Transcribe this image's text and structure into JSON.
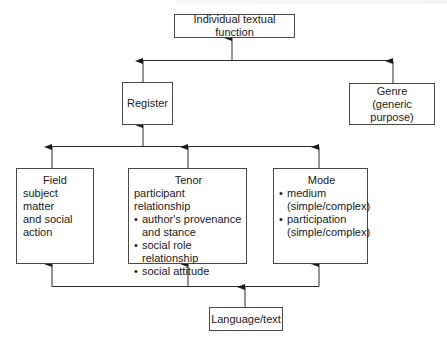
{
  "diagram": {
    "type": "hierarchy-flow",
    "direction": "bottom-to-top",
    "colors": {
      "line": "#2a2a2a",
      "box_border": "#4a4a4a",
      "text": "#1a1a1a",
      "background": "#ffffff"
    },
    "nodes": {
      "individual_textual_function": {
        "label": "Individual textual function"
      },
      "register": {
        "label": "Register"
      },
      "genre": {
        "title": "Genre",
        "subtitle": "(generic purpose)"
      },
      "field": {
        "title": "Field",
        "lines": [
          "subject matter",
          "and social",
          "action"
        ]
      },
      "tenor": {
        "title": "Tenor",
        "subtitle": "participant relationship",
        "bullets": [
          {
            "line1": "author's provenance",
            "line2": "and stance"
          },
          {
            "line1": "social role relationship"
          },
          {
            "line1": "social attitude"
          }
        ]
      },
      "mode": {
        "title": "Mode",
        "bullets": [
          {
            "line1": "medium",
            "line2": "(simple/complex)"
          },
          {
            "line1": "participation",
            "line2": "(simple/complex)"
          }
        ]
      },
      "language_text": {
        "label": "Language/text"
      }
    },
    "edges": [
      {
        "from": "language_text",
        "to": "field"
      },
      {
        "from": "language_text",
        "to": "tenor"
      },
      {
        "from": "language_text",
        "to": "mode"
      },
      {
        "from": "field",
        "to": "register"
      },
      {
        "from": "tenor",
        "to": "register"
      },
      {
        "from": "mode",
        "to": "register"
      },
      {
        "from": "register",
        "to": "individual_textual_function"
      },
      {
        "from": "genre",
        "to": "individual_textual_function"
      }
    ]
  }
}
